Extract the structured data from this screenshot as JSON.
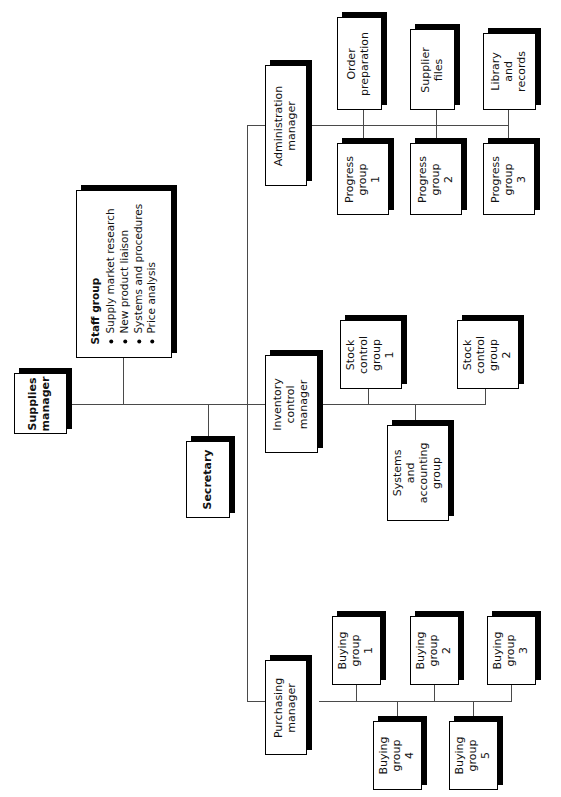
{
  "diagram": {
    "orientation": "rotated-90",
    "colors": {
      "box_fill": "#ffffff",
      "box_border": "#000000",
      "shadow": "#000000",
      "line": "#4a4a4a"
    }
  },
  "nodes": {
    "supplies_manager": {
      "label": "Supplies manager",
      "line1": "Supplies",
      "line2": "manager"
    },
    "secretary": {
      "label": "Secretary"
    },
    "staff_group": {
      "title": "Staff group",
      "items": [
        "Supply market research",
        "New product liaison",
        "Systems and procedures",
        "Price analysis"
      ]
    },
    "administration_manager": {
      "line1": "Administration",
      "line2": "manager"
    },
    "inventory_control_manager": {
      "line1": "Inventory",
      "line2": "control",
      "line3": "manager"
    },
    "purchasing_manager": {
      "line1": "Purchasing",
      "line2": "manager"
    },
    "order_preparation": {
      "line1": "Order",
      "line2": "preparation"
    },
    "supplier_files": {
      "line1": "Supplier",
      "line2": "files"
    },
    "library_and_records": {
      "line1": "Library",
      "line2": "and",
      "line3": "records"
    },
    "progress_group_1": {
      "line1": "Progress",
      "line2": "group",
      "line3": "1"
    },
    "progress_group_2": {
      "line1": "Progress",
      "line2": "group",
      "line3": "2"
    },
    "progress_group_3": {
      "line1": "Progress",
      "line2": "group",
      "line3": "3"
    },
    "stock_control_group_1": {
      "line1": "Stock",
      "line2": "control",
      "line3": "group",
      "line4": "1"
    },
    "stock_control_group_2": {
      "line1": "Stock",
      "line2": "control",
      "line3": "group",
      "line4": "2"
    },
    "systems_and_accounting_group": {
      "line1": "Systems",
      "line2": "and",
      "line3": "accounting",
      "line4": "group"
    },
    "buying_group_1": {
      "line1": "Buying",
      "line2": "group",
      "line3": "1"
    },
    "buying_group_2": {
      "line1": "Buying",
      "line2": "group",
      "line3": "2"
    },
    "buying_group_3": {
      "line1": "Buying",
      "line2": "group",
      "line3": "3"
    },
    "buying_group_4": {
      "line1": "Buying",
      "line2": "group",
      "line3": "4"
    },
    "buying_group_5": {
      "line1": "Buying",
      "line2": "group",
      "line3": "5"
    }
  }
}
